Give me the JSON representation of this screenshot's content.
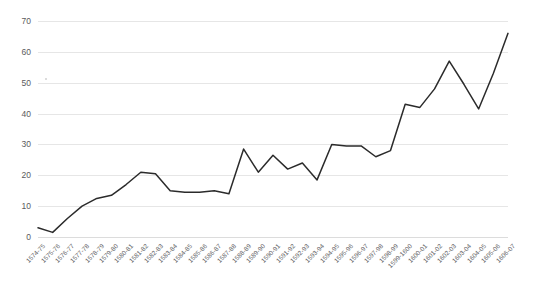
{
  "chart_data": {
    "type": "line",
    "title": "",
    "subtitle": "",
    "xlabel": "",
    "ylabel": "",
    "ylim": [
      0,
      70
    ],
    "yticks": [
      0,
      10,
      20,
      30,
      40,
      50,
      60,
      70
    ],
    "grid": true,
    "legend": "none",
    "line_color": "#2b2b2b",
    "grid_color": "#e6e6e6",
    "categories": [
      "1574-75",
      "1575-76",
      "1576-77",
      "1577-78",
      "1578-79",
      "1579-80",
      "1580-81",
      "1581-82",
      "1582-83",
      "1583-84",
      "1584-85",
      "1585-86",
      "1586-87",
      "1587-88",
      "1588-89",
      "1589-90",
      "1590-91",
      "1591-92",
      "1592-93",
      "1593-94",
      "1594-95",
      "1595-96",
      "1596-97",
      "1597-98",
      "1598-99",
      "1599-1600",
      "1600-01",
      "1601-02",
      "1602-03",
      "1603-04",
      "1604-05",
      "1605-06",
      "1606-07"
    ],
    "values": [
      3,
      1.5,
      6,
      10,
      12.5,
      13.5,
      17,
      21,
      20.5,
      15,
      14.5,
      14.5,
      15,
      14,
      28.5,
      21,
      26.5,
      22,
      24,
      18.5,
      30,
      29.5,
      29.5,
      26,
      28,
      43,
      42,
      48,
      57,
      49.5,
      41.5,
      53,
      66
    ]
  }
}
